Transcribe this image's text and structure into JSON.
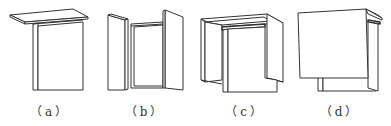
{
  "figures": [
    {
      "id": "a",
      "label": "（a）",
      "description": "cabinet with overhanging top and single door"
    },
    {
      "id": "b",
      "label": "（b）",
      "description": "cabinet with two side doors open"
    },
    {
      "id": "c",
      "label": "（c）",
      "description": "cabinet with wrap-around frame door"
    },
    {
      "id": "d",
      "label": "（d）",
      "description": "cabinet with large overlay door"
    }
  ]
}
